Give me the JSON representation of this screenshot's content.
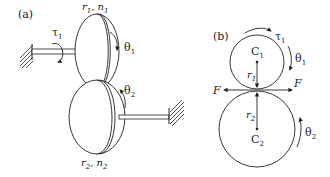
{
  "figure": {
    "panel_a": {
      "label": "(a)",
      "torque": "τ",
      "torque_sub": "1",
      "gear1_r": "r",
      "gear1_r_sub": "1",
      "gear1_sep": ", ",
      "gear1_n": "n",
      "gear1_n_sub": "1",
      "theta1": "θ",
      "theta1_sub": "1",
      "theta2": "θ",
      "theta2_sub": "2",
      "gear2_r": "r",
      "gear2_r_sub": "2",
      "gear2_sep": ", ",
      "gear2_n": "n",
      "gear2_n_sub": "2"
    },
    "panel_b": {
      "label": "(b)",
      "torque": "τ",
      "torque_sub": "1",
      "theta1": "θ",
      "theta1_sub": "1",
      "center1": "C",
      "center1_sub": "1",
      "radius1": "r",
      "radius1_sub": "1",
      "force_left": "F",
      "force_right": "F",
      "radius2": "r",
      "radius2_sub": "2",
      "center2": "C",
      "center2_sub": "2",
      "theta2": "θ",
      "theta2_sub": "2"
    },
    "colors": {
      "stroke": "#222222",
      "background": "#ffffff"
    }
  }
}
